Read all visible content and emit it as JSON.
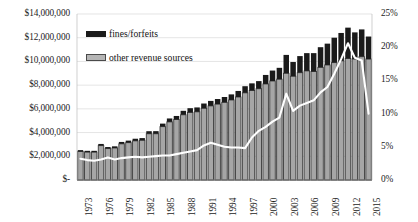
{
  "chart_data": {
    "type": "bar",
    "subtype": "stacked-bar-with-line",
    "title": "",
    "xlabel": "",
    "ylabel": "",
    "y2label": "",
    "grid": true,
    "legend_position": "top-left-inside",
    "ylim": [
      0,
      14000000
    ],
    "y2lim": [
      0,
      0.25
    ],
    "y_ticks": [
      "$-",
      "$2,000,000",
      "$4,000,000",
      "$6,000,000",
      "$8,000,000",
      "$10,000,000",
      "$12,000,000",
      "$14,000,000"
    ],
    "y2_ticks": [
      "0%",
      "5%",
      "10%",
      "15%",
      "20%",
      "25%"
    ],
    "x_tick_labels": [
      "1973",
      "1976",
      "1979",
      "1982",
      "1985",
      "1988",
      "1991",
      "1994",
      "1997",
      "2000",
      "2003",
      "2006",
      "2009",
      "2012",
      "2015"
    ],
    "categories": [
      "1973",
      "1974",
      "1975",
      "1976",
      "1977",
      "1978",
      "1979",
      "1980",
      "1981",
      "1982",
      "1983",
      "1984",
      "1985",
      "1986",
      "1987",
      "1988",
      "1989",
      "1990",
      "1991",
      "1992",
      "1993",
      "1994",
      "1995",
      "1996",
      "1997",
      "1998",
      "1999",
      "2000",
      "2001",
      "2002",
      "2003",
      "2004",
      "2005",
      "2006",
      "2007",
      "2008",
      "2009",
      "2010",
      "2011",
      "2012",
      "2013",
      "2014",
      "2015"
    ],
    "series": [
      {
        "name": "other revenue sources",
        "color": "#a6a6a6",
        "values": [
          2400000,
          2350000,
          2350000,
          2900000,
          2650000,
          2700000,
          3050000,
          3150000,
          3300000,
          3350000,
          3900000,
          3900000,
          4500000,
          4900000,
          5100000,
          5500000,
          5700000,
          5750000,
          6050000,
          6250000,
          6400000,
          6550000,
          6750000,
          7000000,
          7350000,
          7550000,
          7700000,
          8100000,
          8350000,
          8500000,
          9000000,
          8750000,
          9050000,
          9200000,
          9150000,
          9500000,
          9700000,
          9900000,
          10050000,
          10250000,
          10200000,
          10400000,
          10200000
        ]
      },
      {
        "name": "fines/forfeits",
        "color": "#1a1a1a",
        "values": [
          120000,
          110000,
          110000,
          140000,
          130000,
          140000,
          160000,
          170000,
          180000,
          185000,
          215000,
          220000,
          255000,
          290000,
          300000,
          335000,
          355000,
          370000,
          400000,
          420000,
          430000,
          450000,
          470000,
          510000,
          560000,
          600000,
          640000,
          760000,
          880000,
          960000,
          1550000,
          1200000,
          1400000,
          1500000,
          1550000,
          1700000,
          1800000,
          2100000,
          2350000,
          2600000,
          2250000,
          2300000,
          1900000
        ]
      }
    ],
    "line_series": {
      "name": "fines/forfeits share of total revenue",
      "color": "#ffffff",
      "axis": "right",
      "unit": "percent",
      "values": [
        3.2,
        3.0,
        2.9,
        3.1,
        3.4,
        3.1,
        3.3,
        3.4,
        3.5,
        3.4,
        3.5,
        3.6,
        3.7,
        3.7,
        3.9,
        4.1,
        4.3,
        4.5,
        5.2,
        5.6,
        5.3,
        5.0,
        4.9,
        4.9,
        4.8,
        6.4,
        7.4,
        8.0,
        8.8,
        9.4,
        13.0,
        10.4,
        11.2,
        11.6,
        12.0,
        13.2,
        14.0,
        16.0,
        18.2,
        20.6,
        18.4,
        18.0,
        10.0
      ]
    }
  },
  "legend": {
    "items": [
      {
        "label": "fines/forfeits",
        "swatch": "black-bar-swatch"
      },
      {
        "label": "other revenue sources",
        "swatch": "grey-bar-swatch"
      }
    ]
  },
  "colors": {
    "fines_fill": "#1a1a1a",
    "other_fill": "#a6a6a6",
    "other_stroke": "#3a3a3a",
    "line": "#ffffff",
    "gridline": "#d9d9d9",
    "axis_text": "#1c1c1c",
    "background": "#ffffff"
  }
}
